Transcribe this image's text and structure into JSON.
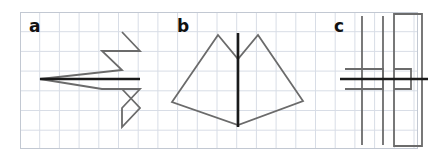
{
  "figure": {
    "canvas": {
      "width": 444,
      "height": 159
    },
    "background_color": "#ffffff",
    "grid": {
      "frame": {
        "x": 20,
        "y": 12,
        "width": 397,
        "height": 136
      },
      "cell_size": 19.7,
      "grid_line_color": "#d8dde6",
      "frame_line_color": "#c2c8d2",
      "grid_visible": true,
      "columns": 20,
      "rows": 7
    },
    "styles": {
      "figure_stroke_color": "#6b6b6b",
      "figure_stroke_width": 1.8,
      "axis_stroke_color": "#1a1a1a",
      "axis_stroke_width": 2.6,
      "label_color": "#111111"
    },
    "panels": [
      {
        "id": "panel-a",
        "label": "a",
        "label_position": {
          "x": 29,
          "y": 32
        },
        "shape_name": "double-chevron-arrow",
        "shape_kind": "polyline",
        "points": "122,32 140,51 102,51 122,70 40,79 102,89 140,89 122,108 122,127 140,108 122,89",
        "closed": false,
        "outline": [
          [
            122,
            32
          ],
          [
            140,
            51
          ],
          [
            102,
            51
          ],
          [
            122,
            70
          ],
          [
            40,
            79
          ],
          [
            102,
            89
          ],
          [
            140,
            89
          ],
          [
            122,
            108
          ],
          [
            122,
            127
          ],
          [
            140,
            108
          ]
        ],
        "symmetry_line": {
          "orientation": "horizontal",
          "from": {
            "x": 40,
            "y": 79
          },
          "to": {
            "x": 140,
            "y": 79
          }
        }
      },
      {
        "id": "panel-b",
        "label": "b",
        "label_position": {
          "x": 177,
          "y": 32
        },
        "shape_name": "symmetric-hexagon-twin-peaks",
        "shape_kind": "polygon",
        "points": "218,35 238,59 258,35 303,101 238,125 172,102",
        "closed": true,
        "outline": [
          [
            218,
            35
          ],
          [
            238,
            59
          ],
          [
            258,
            35
          ],
          [
            303,
            101
          ],
          [
            238,
            125
          ],
          [
            172,
            102
          ]
        ],
        "symmetry_line": {
          "orientation": "vertical",
          "from": {
            "x": 238,
            "y": 33
          },
          "to": {
            "x": 238,
            "y": 127
          }
        }
      },
      {
        "id": "panel-c",
        "label": "c",
        "label_position": {
          "x": 334,
          "y": 32
        },
        "shape_name": "two-vertical-bars-with-notched-tabs",
        "shape_kind": "composite",
        "parts": [
          {
            "name": "left-bar-with-open-tab",
            "points": "362,16 362,145",
            "closed": false
          },
          {
            "name": "left-tab-rectangle",
            "points": "345,69 383,69 383,89 345,89",
            "closed": false
          },
          {
            "name": "left-bar-right-edge",
            "points": "383,16 383,145",
            "closed": false
          },
          {
            "name": "right-bar-rectangle",
            "points": "394,14 422,14 422,146 394,146 394,14",
            "closed": true
          },
          {
            "name": "right-tab-rectangle",
            "points": "394,69 411,69 411,89 394,89",
            "closed": false
          }
        ],
        "symmetry_line": {
          "orientation": "horizontal",
          "from": {
            "x": 340,
            "y": 79
          },
          "to": {
            "x": 428,
            "y": 79
          }
        }
      }
    ]
  }
}
